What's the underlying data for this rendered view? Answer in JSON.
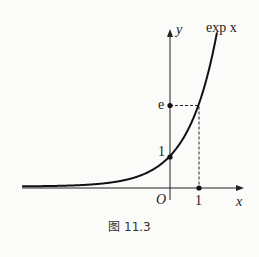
{
  "chart_data": {
    "type": "line",
    "title": "",
    "caption": "图 11.3",
    "curve_label": "exp x",
    "xlabel": "x",
    "ylabel": "y",
    "origin_label": "O",
    "x_ticks": [
      {
        "value": 1,
        "label": "1"
      }
    ],
    "y_ticks": [
      {
        "value": 1,
        "label": "1"
      },
      {
        "value": 2.718,
        "label": "e"
      }
    ],
    "series": [
      {
        "name": "exp x",
        "function": "exp(x)",
        "x": [
          -5.2,
          -4,
          -3,
          -2,
          -1,
          0,
          0.5,
          1,
          1.3,
          1.6
        ],
        "y": [
          0.0055,
          0.018,
          0.05,
          0.135,
          0.368,
          1,
          1.649,
          2.718,
          3.669,
          4.953
        ]
      }
    ],
    "marked_points": [
      {
        "x": 0,
        "y": 1
      },
      {
        "x": 1,
        "y": 0
      },
      {
        "x": 0,
        "y": 2.718
      }
    ],
    "dashed_guides": [
      {
        "from": [
          0,
          2.718
        ],
        "to": [
          1,
          2.718
        ]
      },
      {
        "from": [
          1,
          2.718
        ],
        "to": [
          1,
          0
        ]
      }
    ],
    "grid": false,
    "legend": "none"
  },
  "labels": {
    "curve": "exp x",
    "y_axis": "y",
    "x_axis": "x",
    "origin": "O",
    "tick_x1": "1",
    "tick_y1": "1",
    "tick_e": "e",
    "caption": "图 11.3"
  }
}
